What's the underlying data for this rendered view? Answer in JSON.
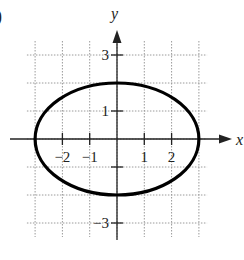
{
  "figure_label_fragment": ")",
  "chart_data": {
    "type": "line",
    "title": "",
    "xlabel": "x",
    "ylabel": "y",
    "xlim": [
      -3.5,
      4
    ],
    "ylim": [
      -3.5,
      4
    ],
    "grid": true,
    "grid_style": "dotted",
    "x_ticks": [
      -2,
      -1,
      1,
      2
    ],
    "x_tick_labels": [
      "−2",
      "−1",
      "1",
      "2"
    ],
    "y_ticks": [
      3,
      1,
      -3
    ],
    "y_tick_labels": [
      "3",
      "1",
      "−3"
    ],
    "series": [
      {
        "name": "ellipse",
        "shape": "ellipse",
        "center": [
          0,
          0
        ],
        "semi_major_x": 3,
        "semi_minor_y": 2,
        "color": "#000000"
      }
    ],
    "legend": null
  }
}
